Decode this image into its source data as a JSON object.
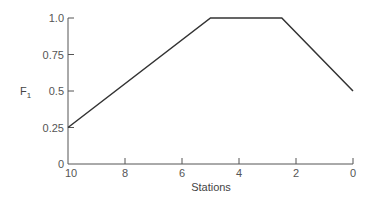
{
  "chart_data": {
    "type": "line",
    "title": "",
    "xlabel": "Stations",
    "ylabel": "F1",
    "ylabel_main": "F",
    "ylabel_sub": "1",
    "x_reversed": true,
    "xlim": [
      10,
      0
    ],
    "ylim": [
      0,
      1.0
    ],
    "x_ticks": [
      10,
      8,
      6,
      4,
      2,
      0
    ],
    "x_tick_labels": [
      "10",
      "8",
      "6",
      "4",
      "2",
      "0"
    ],
    "y_ticks": [
      0,
      0.25,
      0.5,
      0.75,
      1.0
    ],
    "y_tick_labels": [
      "0",
      "0.25",
      "0.5",
      "0.75",
      "1.0"
    ],
    "grid": false,
    "legend": null,
    "series": [
      {
        "name": "F1",
        "x": [
          10,
          5,
          2.5,
          0
        ],
        "y": [
          0.25,
          1.0,
          1.0,
          0.5
        ],
        "color": "#333333"
      }
    ]
  }
}
